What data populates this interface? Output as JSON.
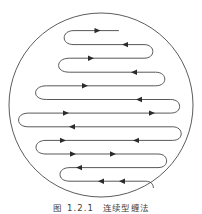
{
  "figure": {
    "caption_number": "图 1.2.1",
    "caption_title": "连续型缠法",
    "accent_color": "#3a3a3a",
    "boundary_color": "#4a4a4a",
    "arrow_color": "#2b2b2b",
    "background_color": "#ffffff"
  },
  "diagram": {
    "type": "serpentine-winding-in-circle",
    "shape_name": "circle",
    "circle": {
      "cx": 101,
      "cy": 105,
      "r": 92
    },
    "pass_count": 14,
    "arrow_count": 16,
    "rows": [
      {
        "index": 1,
        "y": 31,
        "x_left": 72,
        "x_right": 118,
        "direction": "right-to-left"
      },
      {
        "index": 2,
        "y": 42,
        "x_left": 70,
        "x_right": 146,
        "direction": "left-to-right"
      },
      {
        "index": 3,
        "y": 53,
        "x_left": 68,
        "x_right": 148,
        "direction": "right-to-left"
      },
      {
        "index": 4,
        "y": 64,
        "x_left": 48,
        "x_right": 157,
        "direction": "left-to-right"
      },
      {
        "index": 5,
        "y": 75,
        "x_left": 46,
        "x_right": 159,
        "direction": "right-to-left"
      },
      {
        "index": 6,
        "y": 87,
        "x_left": 25,
        "x_right": 172,
        "direction": "left-to-right"
      },
      {
        "index": 7,
        "y": 98,
        "x_left": 23,
        "x_right": 174,
        "direction": "right-to-left"
      },
      {
        "index": 8,
        "y": 110,
        "x_left": 20,
        "x_right": 176,
        "direction": "left-to-right"
      },
      {
        "index": 9,
        "y": 121,
        "x_left": 22,
        "x_right": 174,
        "direction": "right-to-left"
      },
      {
        "index": 10,
        "y": 132,
        "x_left": 45,
        "x_right": 160,
        "direction": "left-to-right"
      },
      {
        "index": 11,
        "y": 143,
        "x_left": 47,
        "x_right": 158,
        "direction": "right-to-left"
      },
      {
        "index": 12,
        "y": 154,
        "x_left": 68,
        "x_right": 147,
        "direction": "left-to-right"
      },
      {
        "index": 13,
        "y": 165,
        "x_left": 70,
        "x_right": 145,
        "direction": "right-to-left"
      },
      {
        "index": 14,
        "y": 176,
        "x_left": 74,
        "x_right": 135,
        "direction": "left-to-right"
      }
    ],
    "arrows": [
      {
        "x": 91,
        "y": 31,
        "dir": "left"
      },
      {
        "x": 125,
        "y": 42,
        "dir": "right"
      },
      {
        "x": 89,
        "y": 53,
        "dir": "left"
      },
      {
        "x": 134,
        "y": 64,
        "dir": "right"
      },
      {
        "x": 85,
        "y": 75,
        "dir": "left"
      },
      {
        "x": 139,
        "y": 87,
        "dir": "right"
      },
      {
        "x": 66,
        "y": 98,
        "dir": "left"
      },
      {
        "x": 152,
        "y": 98,
        "dir": "left"
      },
      {
        "x": 72,
        "y": 110,
        "dir": "right"
      },
      {
        "x": 63,
        "y": 121,
        "dir": "left"
      },
      {
        "x": 136,
        "y": 132,
        "dir": "right"
      },
      {
        "x": 73,
        "y": 143,
        "dir": "left"
      },
      {
        "x": 113,
        "y": 143,
        "dir": "left"
      },
      {
        "x": 79,
        "y": 154,
        "dir": "right"
      },
      {
        "x": 101,
        "y": 165,
        "dir": "right"
      },
      {
        "x": 122,
        "y": 176,
        "dir": "right"
      },
      {
        "x": 99,
        "y": 187,
        "dir": "right"
      }
    ]
  }
}
